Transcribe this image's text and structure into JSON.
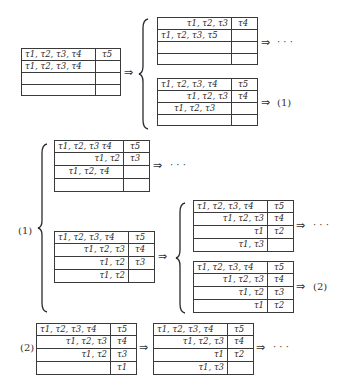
{
  "symbols": {
    "implies": "⇒",
    "ellipsis": "· · ·",
    "label_1": "(1)",
    "label_2": "(2)"
  },
  "diagram": {
    "root_table": {
      "rows": [
        {
          "left": "τ1, τ2, τ3, τ4",
          "right": "τ5"
        },
        {
          "left": "τ1, τ2, τ3, τ4",
          "right": ""
        },
        {
          "left": "",
          "right": ""
        },
        {
          "left": "",
          "right": ""
        }
      ]
    },
    "top_branch_a": {
      "rows": [
        {
          "left": "τ1, τ2, τ3",
          "right": "τ4"
        },
        {
          "left": "τ1, τ2, τ3, τ5",
          "right": ""
        },
        {
          "left": "",
          "right": ""
        },
        {
          "left": "",
          "right": ""
        }
      ],
      "next": "· · ·"
    },
    "top_branch_b": {
      "rows": [
        {
          "left": "τ1, τ2, τ3, τ4",
          "right": "τ5"
        },
        {
          "left": "τ1, τ2, τ3",
          "right": "τ4"
        },
        {
          "left": "τ1, τ2, τ3",
          "right": ""
        },
        {
          "left": "",
          "right": ""
        }
      ],
      "next": "(1)"
    },
    "section_1": {
      "label": "(1)",
      "branch_a": {
        "rows": [
          {
            "left": "τ1, τ2, τ3 τ4",
            "right": "τ5"
          },
          {
            "left": "τ1, τ2",
            "right": "τ3"
          },
          {
            "left": "τ1, τ2, τ4",
            "right": ""
          },
          {
            "left": "",
            "right": ""
          }
        ],
        "next": "· · ·"
      },
      "branch_b": {
        "rows": [
          {
            "left": "τ1, τ2, τ3, τ4",
            "right": "τ5"
          },
          {
            "left": "τ1, τ2, τ3",
            "right": "τ4"
          },
          {
            "left": "τ1, τ2",
            "right": "τ3"
          },
          {
            "left": "τ1, τ2",
            "right": ""
          }
        ],
        "sub_a": {
          "rows": [
            {
              "left": "τ1, τ2, τ3, τ4",
              "right": "τ5"
            },
            {
              "left": "τ1, τ2, τ3",
              "right": "τ4"
            },
            {
              "left": "τ1",
              "right": "τ2"
            },
            {
              "left": "τ1, τ3",
              "right": ""
            }
          ],
          "next": "· · ·"
        },
        "sub_b": {
          "rows": [
            {
              "left": "τ1, τ2, τ3, τ4",
              "right": "τ5"
            },
            {
              "left": "τ1, τ2, τ3",
              "right": "τ4"
            },
            {
              "left": "τ1, τ2",
              "right": "τ3"
            },
            {
              "left": "τ1",
              "right": "τ2"
            }
          ],
          "next": "(2)"
        }
      }
    },
    "section_2": {
      "label": "(2)",
      "table_a": {
        "rows": [
          {
            "left": "τ1, τ2, τ3, τ4",
            "right": "τ5"
          },
          {
            "left": "τ1, τ2, τ3",
            "right": "τ4"
          },
          {
            "left": "τ1, τ2",
            "right": "τ3"
          },
          {
            "left": "",
            "right": "τ1"
          }
        ]
      },
      "table_b": {
        "rows": [
          {
            "left": "τ1, τ2, τ3, τ4",
            "right": "τ5"
          },
          {
            "left": "τ1, τ2, τ3",
            "right": "τ4"
          },
          {
            "left": "τ1",
            "right": "τ2"
          },
          {
            "left": "τ1, τ3",
            "right": ""
          }
        ],
        "next": "· · ·"
      }
    }
  }
}
